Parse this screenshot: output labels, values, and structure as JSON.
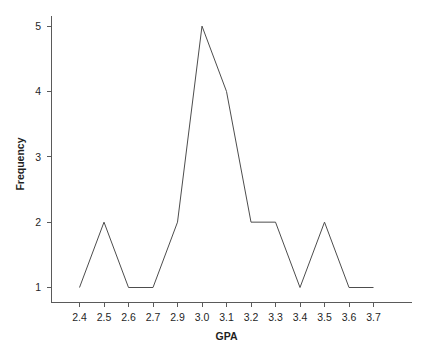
{
  "chart_data": {
    "type": "line",
    "title": "",
    "xlabel": "GPA",
    "ylabel": "Frequency",
    "categories": [
      "2.4",
      "2.5",
      "2.6",
      "2.7",
      "2.9",
      "3.0",
      "3.1",
      "3.2",
      "3.3",
      "3.4",
      "3.5",
      "3.6",
      "3.7"
    ],
    "values": [
      1,
      2,
      1,
      1,
      2,
      5,
      4,
      2,
      2,
      1,
      2,
      1,
      1
    ],
    "series": [
      {
        "name": "Frequency",
        "values": [
          1,
          2,
          1,
          1,
          2,
          5,
          4,
          2,
          2,
          1,
          2,
          1,
          1
        ]
      }
    ],
    "x_tick_labels": [
      "2.4",
      "2.5",
      "2.6",
      "2.7",
      "2.9",
      "3.0",
      "3.1",
      "3.2",
      "3.3",
      "3.4",
      "3.5",
      "3.6",
      "3.7"
    ],
    "y_tick_labels": [
      "1",
      "2",
      "3",
      "4",
      "5"
    ],
    "y_tick_values": [
      1,
      2,
      3,
      4,
      5
    ],
    "ylim": [
      0.75,
      5.35
    ],
    "grid": false,
    "legend": false,
    "legend_position": "none",
    "markers": false,
    "line_color": "#4d4d4d",
    "axis_color": "#5a5a5a",
    "background_color": "#ffffff",
    "annotations": []
  },
  "axes": {
    "x_title": "GPA",
    "y_title": "Frequency"
  }
}
